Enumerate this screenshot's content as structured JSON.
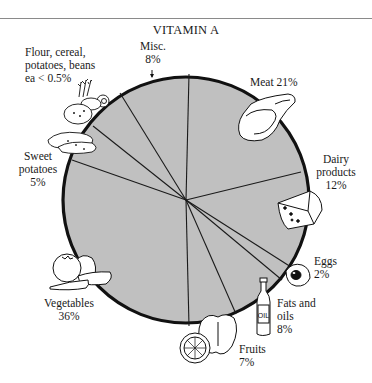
{
  "chart_data": {
    "type": "pie",
    "title": "VITAMIN A",
    "categories": [
      "Misc.",
      "Meat",
      "Dairy products",
      "Eggs",
      "Fats and oils",
      "Fruits",
      "Vegetables",
      "Sweet potatoes",
      "Flour, cereal, potatoes, beans"
    ],
    "values": [
      8,
      21,
      12,
      2,
      8,
      7,
      36,
      5,
      0.5
    ],
    "value_labels": [
      "8%",
      "21%",
      "12%",
      "2%",
      "8%",
      "7%",
      "36%",
      "5%",
      "ea < 0.5%"
    ],
    "unit": "%",
    "fill_color": "#c0c0c0",
    "outline_color": "#111111",
    "legend": "none (labels placed around pie with food illustrations)",
    "slice_boundaries": [
      {
        "x": 189,
        "y": 74
      },
      {
        "x": 301,
        "y": 172
      },
      {
        "x": 291,
        "y": 267
      },
      {
        "x": 282,
        "y": 280
      },
      {
        "x": 236,
        "y": 314
      },
      {
        "x": 189,
        "y": 326
      },
      {
        "x": 72,
        "y": 160
      },
      {
        "x": 93,
        "y": 126
      },
      {
        "x": 120,
        "y": 93
      }
    ]
  },
  "header": {
    "title": "VITAMIN A"
  },
  "labels": {
    "misc": {
      "line1": "Misc.",
      "line2": "8%"
    },
    "meat": {
      "line1": "Meat 21%"
    },
    "dairy": {
      "line1": "Dairy",
      "line2": "products",
      "line3": "12%"
    },
    "eggs": {
      "line1": "Eggs",
      "line2": "2%"
    },
    "fats": {
      "line1": "Fats and",
      "line2": "oils",
      "line3": "8%"
    },
    "fruits": {
      "line1": "Fruits",
      "line2": "7%"
    },
    "vegetables": {
      "line1": "Vegetables",
      "line2": "36%"
    },
    "sweet_potatoes": {
      "line1": "Sweet",
      "line2": "potatoes",
      "line3": "5%"
    },
    "flour": {
      "line1": "Flour, cereal,",
      "line2": "potatoes, beans",
      "line3": "ea < 0.5%"
    }
  },
  "icons": {
    "oil_bottle_text": "OIL"
  }
}
